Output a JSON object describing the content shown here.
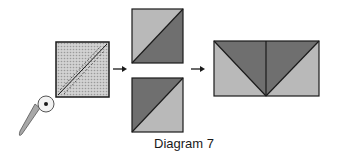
{
  "caption": "Diagram 7",
  "colors": {
    "light_fabric": "#b9b9b9",
    "dark_fabric": "#6f6f6f",
    "outline": "#1a1a1a",
    "background": "#ffffff",
    "cutter_handle": "#a8a8a8"
  },
  "steps": [
    {
      "name": "layered-square-with-cut-lines",
      "description": "square marked with diagonal and stitching lines"
    },
    {
      "name": "half-square-triangles",
      "count": 2
    },
    {
      "name": "flying-geese-unit"
    }
  ]
}
